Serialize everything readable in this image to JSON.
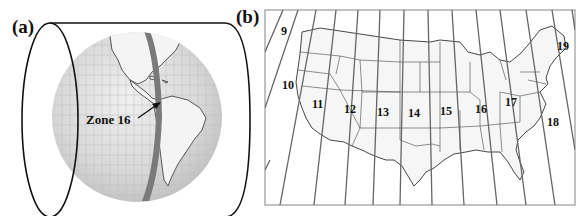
{
  "figure": {
    "panel_a": {
      "label": "(a)",
      "annotation": "Zone 16",
      "highlight_color": "#777777",
      "globe_color": "#dcdcdc"
    },
    "panel_b": {
      "label": "(b)",
      "zones": [
        {
          "label": "9",
          "x": 281,
          "y": 35
        },
        {
          "label": "10",
          "x": 282,
          "y": 89
        },
        {
          "label": "11",
          "x": 312,
          "y": 108
        },
        {
          "label": "12",
          "x": 344,
          "y": 113
        },
        {
          "label": "13",
          "x": 377,
          "y": 116
        },
        {
          "label": "14",
          "x": 408,
          "y": 117
        },
        {
          "label": "15",
          "x": 440,
          "y": 115
        },
        {
          "label": "16",
          "x": 475,
          "y": 113
        },
        {
          "label": "17",
          "x": 505,
          "y": 106
        },
        {
          "label": "18",
          "x": 547,
          "y": 126
        },
        {
          "label": "19",
          "x": 557,
          "y": 50
        }
      ]
    }
  }
}
